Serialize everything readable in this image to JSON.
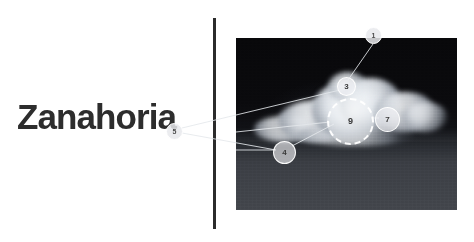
{
  "page": {
    "title": "Zanahoria",
    "background_color": "#ffffff",
    "width": 474,
    "height": 242
  },
  "divider": {
    "name": "vertical-divider",
    "color": "#2b2b2b"
  },
  "media": {
    "name": "night-cloud-photograph",
    "description": "Dark night sky photograph with a brightly illuminated cloud",
    "sky_color": "#0a0a0c",
    "ground_color": "#42454b",
    "cloud_color": "#f4f6f8"
  },
  "markers": [
    {
      "id": "marker-1",
      "label": "1",
      "x": 365,
      "y": 27,
      "size": 17,
      "font_size": 7,
      "dashed": false,
      "on_white": true
    },
    {
      "id": "marker-3",
      "label": "3",
      "x": 337,
      "y": 77,
      "size": 19,
      "font_size": 8,
      "dashed": false,
      "on_white": false
    },
    {
      "id": "marker-9",
      "label": "9",
      "x": 327,
      "y": 98,
      "size": 47,
      "font_size": 9,
      "dashed": true,
      "on_white": false
    },
    {
      "id": "marker-7",
      "label": "7",
      "x": 375,
      "y": 107,
      "size": 25,
      "font_size": 8,
      "dashed": false,
      "on_white": false
    },
    {
      "id": "marker-4",
      "label": "4",
      "x": 273,
      "y": 141,
      "size": 23,
      "font_size": 8,
      "dashed": false,
      "on_white": false
    },
    {
      "id": "marker-5",
      "label": "5",
      "x": 166,
      "y": 123,
      "size": 17,
      "font_size": 7,
      "dashed": false,
      "on_white": true
    }
  ],
  "connectors": [
    {
      "id": "connector-1-to-3",
      "x1": 373,
      "y1": 44,
      "x2": 348,
      "y2": 80
    },
    {
      "id": "connector-5-to-3",
      "x1": 182,
      "y1": 128,
      "x2": 340,
      "y2": 90
    },
    {
      "id": "connector-5-to-4",
      "x1": 182,
      "y1": 133,
      "x2": 276,
      "y2": 150
    },
    {
      "id": "connector-4-to-9",
      "x1": 292,
      "y1": 146,
      "x2": 334,
      "y2": 124
    },
    {
      "id": "connector-9-to-7",
      "x1": 371,
      "y1": 118,
      "x2": 379,
      "y2": 118
    },
    {
      "id": "connector-left-edge-4",
      "x1": 236,
      "y1": 150,
      "x2": 274,
      "y2": 150
    },
    {
      "id": "connector-left-edge-9",
      "x1": 236,
      "y1": 132,
      "x2": 330,
      "y2": 122
    }
  ]
}
